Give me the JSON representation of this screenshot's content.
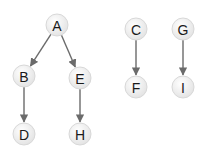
{
  "diagram": {
    "type": "directed-forest",
    "nodes": [
      {
        "id": "A",
        "label": "A",
        "x": 57,
        "y": 25
      },
      {
        "id": "B",
        "label": "B",
        "x": 24,
        "y": 76
      },
      {
        "id": "E",
        "label": "E",
        "x": 80,
        "y": 78
      },
      {
        "id": "D",
        "label": "D",
        "x": 24,
        "y": 134
      },
      {
        "id": "H",
        "label": "H",
        "x": 80,
        "y": 134
      },
      {
        "id": "C",
        "label": "C",
        "x": 136,
        "y": 29
      },
      {
        "id": "F",
        "label": "F",
        "x": 136,
        "y": 87
      },
      {
        "id": "G",
        "label": "G",
        "x": 183,
        "y": 29
      },
      {
        "id": "I",
        "label": "I",
        "x": 183,
        "y": 87
      }
    ],
    "edges": [
      {
        "from": "A",
        "to": "B"
      },
      {
        "from": "A",
        "to": "E"
      },
      {
        "from": "B",
        "to": "D"
      },
      {
        "from": "E",
        "to": "H"
      },
      {
        "from": "C",
        "to": "F"
      },
      {
        "from": "G",
        "to": "I"
      }
    ],
    "colors": {
      "edge": "#6b6b6b",
      "node_fill": "#f2f2f2",
      "node_stroke": "#d8d8d8",
      "label": "#1a1a1a"
    }
  }
}
